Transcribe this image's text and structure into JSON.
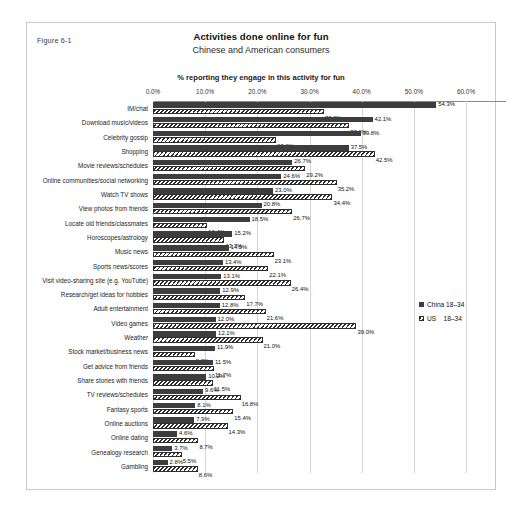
{
  "figure": {
    "number_label": "Figure 6-1"
  },
  "chart_data": {
    "type": "bar",
    "orientation": "horizontal",
    "title": "Activities done online for fun",
    "subtitle": "Chinese and American consumers",
    "axis_title": "%  reporting they engage in this activity for fun",
    "xlabel": "",
    "ylabel": "",
    "xlim": [
      0,
      60
    ],
    "xticks": [
      "0.0%",
      "10.0%",
      "20.0%",
      "30.0%",
      "40.0%",
      "50.0%",
      "60.0%"
    ],
    "xtick_values": [
      0,
      10,
      20,
      30,
      40,
      50,
      60
    ],
    "grid": true,
    "legend_position": "right",
    "legend": [
      "China 18–34",
      "US    18–34"
    ],
    "categories": [
      "IM/chat",
      "Download music/videos",
      "Celebrity gossip",
      "Shopping",
      "Movie reviews/schedules",
      "Online communities/social networking",
      "Watch TV shows",
      "View photos from friends",
      "Locate old friends/classmates",
      "Horoscopes/astrology",
      "Music news",
      "Sports news/scores",
      "Visit video-sharing site (e.g. YouTube)",
      "Research/get ideas for hobbies",
      "Adult entertainment",
      "Video games",
      "Weather",
      "Stock market/business news",
      "Get advice from friends",
      "Share stories with friends",
      "TV reviews/schedules",
      "Fantasy sports",
      "Online auctions",
      "Online dating",
      "Genealogy research",
      "Gambling"
    ],
    "series": [
      {
        "name": "China 18–34",
        "values": [
          54.3,
          42.1,
          39.8,
          37.5,
          26.7,
          24.6,
          23.0,
          20.8,
          18.5,
          15.2,
          14.5,
          13.4,
          13.1,
          12.9,
          12.8,
          12.0,
          12.1,
          11.9,
          11.5,
          10.2,
          9.6,
          8.1,
          7.9,
          4.6,
          3.7,
          2.8
        ],
        "labels": [
          "54.3%",
          "42.1%",
          "39.8%",
          "37.5%",
          "26.7%",
          "24.6%",
          "23.0%",
          "20.8%",
          "18.5%",
          "15.2%",
          "14.5%",
          "13.4%",
          "13.1%",
          "12.9%",
          "12.8%",
          "12.0%",
          "12.1%",
          "11.9%",
          "11.5%",
          "10.2%",
          "9.6%",
          "8.1%",
          "7.9%",
          "4.6%",
          "3.7%",
          "2.8%"
        ]
      },
      {
        "name": "US 18–34",
        "values": [
          32.8,
          37.6,
          23.6,
          42.5,
          29.2,
          35.2,
          34.4,
          26.7,
          10.4,
          13.7,
          23.1,
          22.1,
          26.4,
          17.7,
          21.6,
          39.0,
          21.0,
          8.0,
          11.7,
          11.5,
          16.8,
          15.4,
          14.3,
          8.7,
          5.5,
          8.6
        ],
        "labels": [
          "32.8%",
          "37.6%",
          "23.6%",
          "42.5%",
          "29.2%",
          "35.2%",
          "34.4%",
          "26.7%",
          "10.4%",
          "13.7%",
          "23.1%",
          "22.1%",
          "26.4%",
          "17.7%",
          "21.6%",
          "39.0%",
          "21.0%",
          "8.0%",
          "11.7%",
          "11.5%",
          "16.8%",
          "15.4%",
          "14.3%",
          "8.7%",
          "5.5%",
          "8.6%"
        ]
      }
    ]
  }
}
